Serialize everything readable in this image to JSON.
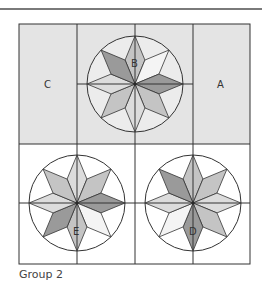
{
  "figure": {
    "caption": "Group 2",
    "labels": {
      "A": "A",
      "B": "B",
      "C": "C",
      "D": "D",
      "E": "E"
    },
    "colors": {
      "top_row_fill": "#e4e4e4",
      "bottom_row_fill": "#ffffff",
      "line": "#333333",
      "rule": "#7a7a7a",
      "shade_dark": "#9a9a9a",
      "shade_mid": "#c4c4c4",
      "shade_light": "#dcdcdc",
      "shade_white": "#f4f4f4"
    },
    "blocks": [
      {
        "label": "C",
        "position": "top-left",
        "type": "plain"
      },
      {
        "label": "B",
        "position": "top-center",
        "type": "eight-point-star"
      },
      {
        "label": "A",
        "position": "top-right",
        "type": "plain"
      },
      {
        "label": "E",
        "position": "bottom-left",
        "type": "eight-point-star"
      },
      {
        "label": "D",
        "position": "bottom-right",
        "type": "eight-point-star"
      }
    ]
  }
}
